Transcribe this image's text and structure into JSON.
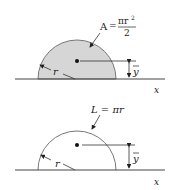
{
  "figures": [
    {
      "name": "semicircular-area",
      "formula_lhs": "A",
      "formula_eq": "=",
      "formula_num": "πr",
      "formula_num_exp": "2",
      "formula_den": "2",
      "radius_label": "r",
      "centroid_label": "y",
      "axis_label": "x",
      "fill_color": "#d6d6d6"
    },
    {
      "name": "semicircular-arc",
      "formula": "L = πr",
      "radius_label": "r",
      "centroid_label": "y",
      "axis_label": "x"
    }
  ]
}
